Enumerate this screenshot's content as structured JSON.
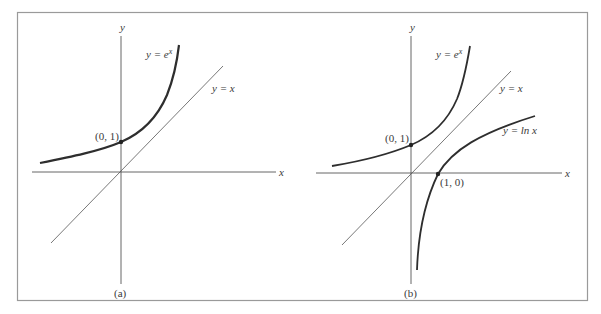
{
  "figure": {
    "panels": [
      {
        "id": "a",
        "caption": "(a)",
        "axis_x_label": "x",
        "axis_y_label": "y",
        "curves": [
          {
            "name": "exp",
            "label_base": "y = e",
            "label_sup": "x"
          },
          {
            "name": "identity",
            "label": "y = x"
          }
        ],
        "points": [
          {
            "label": "(0, 1)",
            "x": 0,
            "y": 1
          }
        ]
      },
      {
        "id": "b",
        "caption": "(b)",
        "axis_x_label": "x",
        "axis_y_label": "y",
        "curves": [
          {
            "name": "exp",
            "label_base": "y = e",
            "label_sup": "x"
          },
          {
            "name": "identity",
            "label": "y = x"
          },
          {
            "name": "ln",
            "label": "y = ln x"
          }
        ],
        "points": [
          {
            "label": "(0, 1)",
            "x": 0,
            "y": 1
          },
          {
            "label": "(1, 0)",
            "x": 1,
            "y": 0
          }
        ]
      }
    ],
    "colors": {
      "frame": "#9a9a9a",
      "axis": "#555555",
      "curve": "#333333",
      "text": "#3a3a3a"
    }
  }
}
